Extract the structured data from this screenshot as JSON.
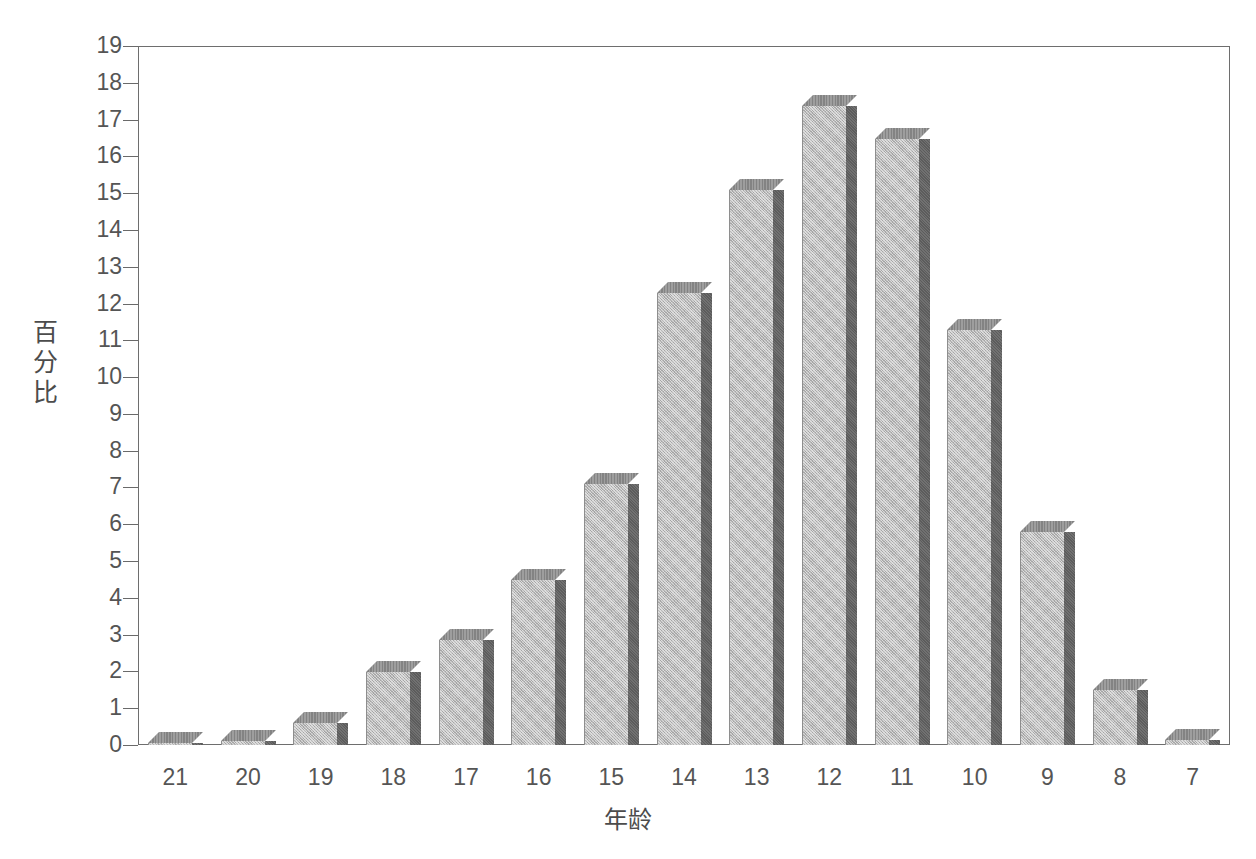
{
  "chart_data": {
    "type": "bar",
    "title": "",
    "subtitle": "",
    "xlabel": "年龄",
    "ylabel": "百分比",
    "categories": [
      "21",
      "20",
      "19",
      "18",
      "17",
      "16",
      "15",
      "14",
      "13",
      "12",
      "11",
      "10",
      "9",
      "8",
      "7"
    ],
    "values": [
      0.03,
      0.1,
      0.6,
      2.0,
      2.85,
      4.5,
      7.1,
      12.3,
      15.1,
      17.4,
      16.5,
      11.3,
      5.8,
      1.5,
      0.15
    ],
    "series": [
      {
        "name": "百分比",
        "values": [
          0.03,
          0.1,
          0.6,
          2.0,
          2.85,
          4.5,
          7.1,
          12.3,
          15.1,
          17.4,
          16.5,
          11.3,
          5.8,
          1.5,
          0.15
        ]
      }
    ],
    "ylim": [
      0,
      19
    ],
    "xlim": [
      0,
      15
    ],
    "ytick_labels": [
      "0",
      "1",
      "2",
      "3",
      "4",
      "5",
      "6",
      "7",
      "8",
      "9",
      "10",
      "11",
      "12",
      "13",
      "14",
      "15",
      "16",
      "17",
      "18",
      "19"
    ],
    "ytick_values": [
      0,
      1,
      2,
      3,
      4,
      5,
      6,
      7,
      8,
      9,
      10,
      11,
      12,
      13,
      14,
      15,
      16,
      17,
      18,
      19
    ],
    "grid": false,
    "legend": null,
    "legend_position": "none",
    "annotations": [],
    "style": {
      "bar_face_color": "#b9b9b9",
      "bar_side_color": "#5c5c5c",
      "bar_top_color": "#838383",
      "axis_color": "#6e6e6e",
      "text_color": "#555555",
      "background_color": "#ffffff",
      "three_d": true
    }
  }
}
